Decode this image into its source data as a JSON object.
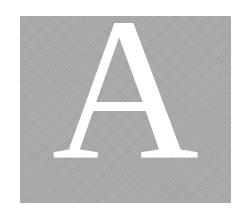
{
  "tile": {
    "letter": "A",
    "background_color": "#a9a9a9",
    "letter_color": "#ffffff"
  }
}
